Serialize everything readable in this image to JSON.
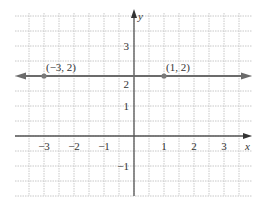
{
  "chart_data": {
    "type": "line",
    "title": "",
    "xlabel": "x",
    "ylabel": "y",
    "xlim": [
      -4,
      4
    ],
    "ylim": [
      -2,
      4
    ],
    "grid": true,
    "grid_step": 0.5,
    "x_ticks": [
      -3,
      -2,
      -1,
      1,
      2,
      3
    ],
    "y_ticks": [
      -1,
      1,
      2,
      3
    ],
    "x_tick_labels": [
      "−3",
      "−2",
      "−1",
      "1",
      "2",
      "3"
    ],
    "y_tick_labels": [
      "−1",
      "1",
      "2",
      "3"
    ],
    "series": [
      {
        "name": "y = 2",
        "equation": "y = 2",
        "line_type": "horizontal line with arrows at both ends",
        "y": 2,
        "color": "#6b6b6b"
      }
    ],
    "points": [
      {
        "x": -3,
        "y": 2,
        "label": "(−3, 2)"
      },
      {
        "x": 1,
        "y": 2,
        "label": "(1, 2)"
      }
    ],
    "colors": {
      "line": "#6b6b6b",
      "axis": "#555555",
      "grid": "#c8c8c8",
      "point": "#7a7a7a"
    }
  }
}
